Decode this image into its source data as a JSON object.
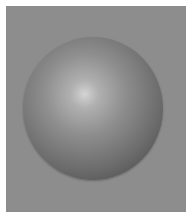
{
  "image": {
    "subject": "Shaded gray sphere on gray background",
    "colors": {
      "background": "#8d8d8d",
      "border": "#ffffff",
      "highlight": "#d4d4d4",
      "shadow": "#3e3e3e"
    }
  }
}
